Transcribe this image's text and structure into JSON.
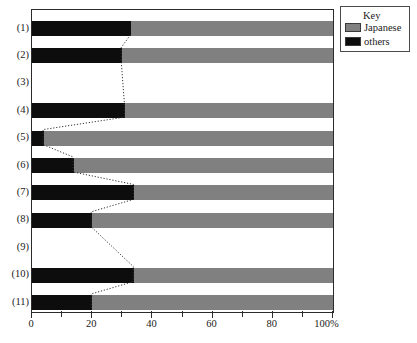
{
  "chart_data": {
    "type": "bar",
    "orientation": "horizontal",
    "stacked": true,
    "title": "",
    "xlabel": "",
    "ylabel": "",
    "xlim": [
      0,
      100
    ],
    "xticks": [
      0,
      10,
      20,
      30,
      40,
      50,
      60,
      70,
      80,
      90,
      100
    ],
    "xtick_labels": [
      "0",
      "",
      "20",
      "",
      "40",
      "",
      "60",
      "",
      "80",
      "",
      "100%"
    ],
    "grid": false,
    "categories": [
      "(1)",
      "(2)",
      "(3)",
      "(4)",
      "(5)",
      "(6)",
      "(7)",
      "(8)",
      "(9)",
      "(10)",
      "(11)"
    ],
    "series": [
      {
        "name": "others",
        "color": "#0d0d0d",
        "values": [
          33,
          30,
          null,
          31,
          4,
          14,
          34,
          20,
          null,
          34,
          20
        ]
      },
      {
        "name": "Japanese",
        "color": "#808080",
        "values": [
          67,
          70,
          null,
          69,
          96,
          86,
          66,
          80,
          null,
          66,
          80
        ]
      }
    ],
    "empty_categories": [
      "(3)",
      "(9)"
    ],
    "annotations": {
      "connector_style": "dotted",
      "connector_description": "Dotted line connecting the boundary between 'others' and 'Japanese' segments across consecutive categories"
    }
  },
  "legend": {
    "title": "Key",
    "position": "top-right",
    "entries": [
      {
        "label": "Japanese",
        "color": "#808080"
      },
      {
        "label": "others",
        "color": "#0d0d0d"
      }
    ]
  },
  "axis": {
    "x_unit_suffix": "%"
  }
}
